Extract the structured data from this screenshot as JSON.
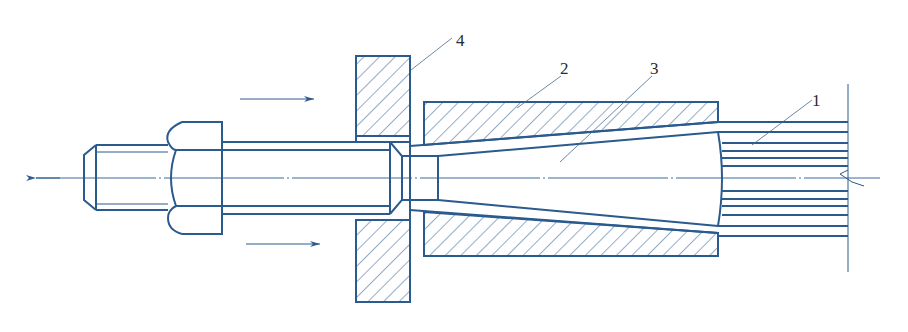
{
  "diagram": {
    "colors": {
      "line": "#2a5a8e",
      "label": "#2b2b2b",
      "background": "#ffffff"
    },
    "labels": [
      {
        "id": "1",
        "text": "1",
        "part": "strands"
      },
      {
        "id": "2",
        "text": "2",
        "part": "anchor-sleeve"
      },
      {
        "id": "3",
        "text": "3",
        "part": "tapered-wedge"
      },
      {
        "id": "4",
        "text": "4",
        "part": "bearing-plate"
      }
    ],
    "arrows": [
      {
        "name": "upper-push-arrow",
        "direction": "right"
      },
      {
        "name": "lower-push-arrow",
        "direction": "right"
      },
      {
        "name": "pull-axis-arrow",
        "direction": "left"
      }
    ]
  }
}
